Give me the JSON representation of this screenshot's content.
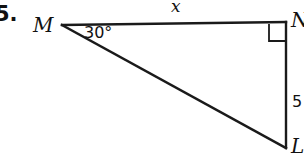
{
  "problem": {
    "number": "5."
  },
  "figure": {
    "type": "right-triangle",
    "vertices": [
      {
        "id": "M",
        "label": "M",
        "x": 62,
        "y": 25
      },
      {
        "id": "N",
        "label": "N",
        "x": 286,
        "y": 22
      },
      {
        "id": "L",
        "label": "L",
        "x": 286,
        "y": 148
      }
    ],
    "sides": [
      {
        "id": "MN",
        "label": "x",
        "from": "M",
        "to": "N",
        "known": false
      },
      {
        "id": "NL",
        "label": "5",
        "from": "N",
        "to": "L",
        "known": true
      },
      {
        "id": "ML",
        "label": "",
        "from": "M",
        "to": "L",
        "known": false
      }
    ],
    "angles": [
      {
        "at": "M",
        "label": "30°",
        "value": 30
      },
      {
        "at": "N",
        "label": "",
        "value": 90,
        "marker": "right-angle-square"
      }
    ],
    "stroke_color": "#1a1a1a",
    "stroke_width": 2.4,
    "background_color": "#ffffff"
  },
  "labels": {
    "vertex_M": "M",
    "vertex_N": "N",
    "vertex_L": "L",
    "side_top": "x",
    "side_right": "5",
    "angle_at_M": "30°"
  }
}
